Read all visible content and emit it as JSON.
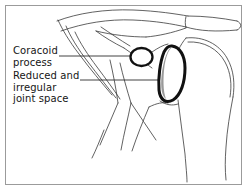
{
  "figure": {
    "frame_color": "#9b9b9b",
    "background": "#ffffff"
  },
  "labels": {
    "coracoid": {
      "name": "coracoid-process-label",
      "line1": "Coracoid",
      "line2": "process"
    },
    "joint_space": {
      "name": "joint-space-label",
      "line1": "Reduced and",
      "line2": "irregular",
      "line3": "joint space"
    }
  },
  "annotations": [
    {
      "id": "coracoid-leader",
      "target": "coracoid-process-circle",
      "from_x": 59,
      "from_y": 56,
      "to_x": 132,
      "to_y": 56
    },
    {
      "id": "joint-space-leader",
      "target": "joint-space-outline",
      "from_x": 80,
      "from_y": 80,
      "to_x": 166,
      "to_y": 80
    }
  ],
  "shapes": {
    "coracoid_circle": {
      "name": "coracoid-process-circle",
      "cx": 141.5,
      "cy": 57,
      "rx": 11,
      "ry": 9,
      "stroke": "#111111",
      "stroke_width": 2.2,
      "fill": "#ffffff"
    },
    "joint_space": {
      "name": "joint-space-outline",
      "stroke": "#111111",
      "stroke_width": 3.0,
      "fill": "#ffffff",
      "shading_fill": "#9a9a9a",
      "bbox": [
        160,
        45,
        26,
        58
      ]
    },
    "bone_outline": {
      "name": "bone-outline-strokes",
      "stroke": "#3a3a3a",
      "stroke_width": 0.8
    }
  },
  "colors": {
    "ink": "#111111",
    "thin_ink": "#3a3a3a",
    "shade_gray": "#9a9a9a",
    "frame_gray": "#9b9b9b",
    "text": "#151515",
    "paper": "#ffffff"
  }
}
